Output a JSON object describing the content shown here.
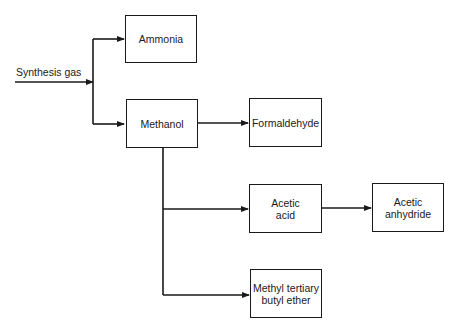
{
  "diagram": {
    "input_label": "Synthesis gas",
    "nodes": {
      "ammonia": "Ammonia",
      "methanol": "Methanol",
      "formaldehyde": "Formaldehyde",
      "acetic_acid": "Acetic\nacid",
      "acetic_anhydride": "Acetic\nanhydride",
      "mtbe": "Methyl tertiary\nbutyl ether"
    },
    "edges": [
      [
        "Synthesis gas",
        "Ammonia"
      ],
      [
        "Synthesis gas",
        "Methanol"
      ],
      [
        "Methanol",
        "Formaldehyde"
      ],
      [
        "Methanol",
        "Acetic acid"
      ],
      [
        "Methanol",
        "Methyl tertiary butyl ether"
      ],
      [
        "Acetic acid",
        "Acetic anhydride"
      ]
    ],
    "colors": {
      "line": "#1a1a1a",
      "background": "#ffffff"
    }
  }
}
